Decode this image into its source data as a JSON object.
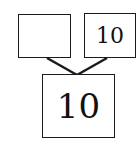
{
  "diagram": {
    "type": "number-bond",
    "whole": {
      "value": "10"
    },
    "parts": [
      {
        "value": ""
      },
      {
        "value": "10"
      }
    ],
    "colors": {
      "stroke": "#1a1a1a",
      "background": "#ffffff"
    }
  }
}
